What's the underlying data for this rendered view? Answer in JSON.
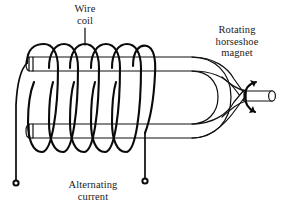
{
  "diagram": {
    "background_color": "#ffffff",
    "ink_color": "#111111",
    "labels": {
      "wire_coil": "Wire\ncoil",
      "rotating_magnet": "Rotating\nhorseshoe\nmagnet",
      "alternating_current": "Alternating\ncurrent"
    },
    "parts": [
      {
        "name": "wire-coil",
        "description": "Helical wire coil of 6 turns wound around the horseshoe magnet arms"
      },
      {
        "name": "horseshoe-magnet",
        "description": "U-shaped rotating horseshoe magnet with two parallel arms"
      },
      {
        "name": "magnet-shaft",
        "description": "Cylindrical rotation shaft on the right side of the magnet"
      },
      {
        "name": "rotation-arrow",
        "description": "Curved double-headed arrow around the shaft indicating rotation"
      },
      {
        "name": "lead-wire-left",
        "description": "Coil lead descending to the left output terminal"
      },
      {
        "name": "lead-wire-right",
        "description": "Coil lead descending to the right output terminal"
      },
      {
        "name": "terminal-left",
        "description": "Left output terminal dot"
      },
      {
        "name": "terminal-right",
        "description": "Right output terminal dot"
      },
      {
        "name": "leader-line-wire-coil",
        "description": "Leader line from the Wire coil label to the coil"
      }
    ],
    "coil": {
      "turns": 6,
      "turn_x_positions": [
        40,
        62,
        84,
        106,
        128,
        145
      ],
      "top_y": 48,
      "bottom_y": 152
    },
    "terminals": [
      {
        "name": "terminal-left",
        "x": 16,
        "y": 183
      },
      {
        "name": "terminal-right",
        "x": 145,
        "y": 181
      }
    ]
  }
}
